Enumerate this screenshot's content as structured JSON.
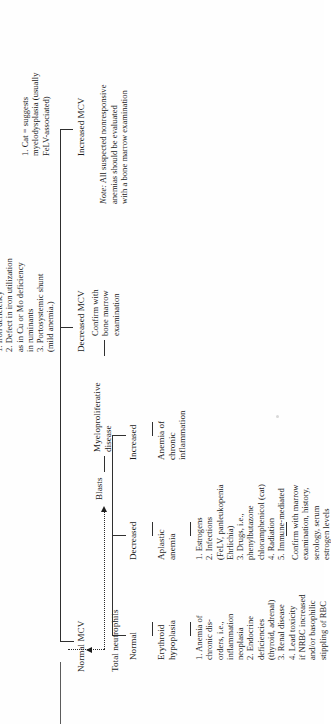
{
  "document": {
    "kind": "flowchart",
    "subject": "Anemia classification by MCV and bone marrow response",
    "orientation": "rotated-90-ccw"
  },
  "branches": {
    "normal_mcv": {
      "label": "Normal MCV",
      "sub_label": "Total neutrophils",
      "columns": [
        {
          "heading": "Normal",
          "node": "Erythroid\nhypoplasia",
          "items": "1. Anemia of\nchronic dis-\norders, i.e.,\ninflammation\nneoplasia\n2. Endocrine\ndeficiencies\n(thyroid, adrenal)\n3. Renal disease\n4. Lead toxicity\nif NRBC increased\nand/or basophilic\nstippling of RBC"
        },
        {
          "heading": "Decreased",
          "node": "Aplastic\nanemia",
          "items": "1. Estrogens\n2. Infections\n(FeLV, panleukopenia\nEhrlichia)\n3. Drugs, i.e.,\nphenylbutazone\nchloramphenicol (cat)\n4. Radiation\n5. Immune-mediated",
          "footer": "Confirm with marrow\nexamination, history,\nserology, serum\nestrogen levels"
        },
        {
          "heading": "Increased",
          "node": "Anemia of\nchronic\ninflammation"
        }
      ]
    },
    "blasts": {
      "label": "Blasts",
      "node": "Myeloproliferative\ndisease",
      "footer": "Confirm with\nbone marrow\nexamination"
    },
    "decreased_mcv": {
      "label": "Decreased MCV",
      "items": "1. Iron deficiency\n2. Defect in iron utilization\nas in Cu or Mo deficiency\nin ruminants\n3. Portosystemic shunt\n(mild anemia.)"
    },
    "increased_mcv": {
      "label": "Increased MCV",
      "items": "1. Cat = suggests\nmyelodysplasia (usually\nFeLV-associated)"
    }
  },
  "note": {
    "prefix": "Note:",
    "text": " All suspected nonresponsive\nanemias should be evaluated\nwith a bone marrow examination"
  },
  "colors": {
    "ink": "#1b1b1b",
    "rule": "#2e2e2e",
    "paper": "#ffffff"
  }
}
